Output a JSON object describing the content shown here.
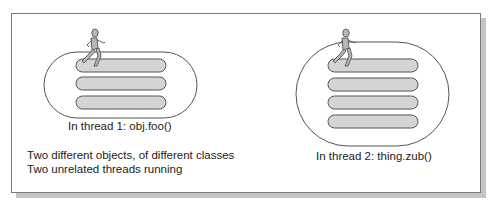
{
  "diagram": {
    "left": {
      "caption": "In thread 1: obj.foo()",
      "lanes": 3
    },
    "right": {
      "caption": "In thread 2: thing.zub()",
      "lanes": 4
    },
    "notes": [
      "Two different objects, of different classes",
      "Two unrelated threads running"
    ],
    "colors": {
      "lane_fill": "#d4d4d4",
      "outline": "#555555",
      "runner_fill": "#b8b8b8",
      "shadow": "#c4c4c4"
    }
  }
}
